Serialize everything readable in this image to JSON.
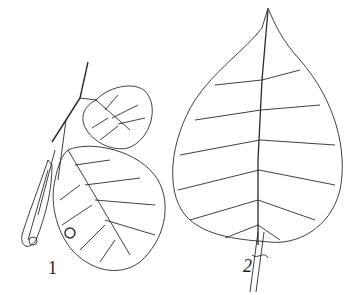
{
  "figure": {
    "labels": [
      "1",
      "2"
    ],
    "line_color": "#2a2a2a",
    "background": "#ffffff"
  }
}
